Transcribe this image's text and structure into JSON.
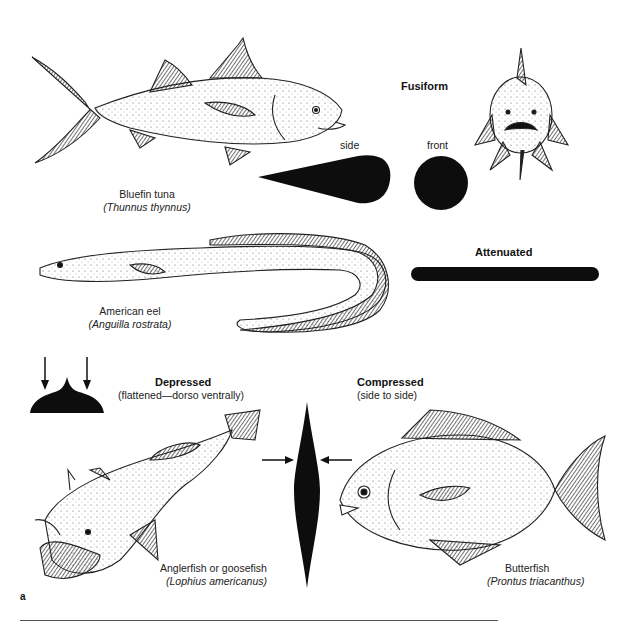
{
  "figure": {
    "panel_label": "a",
    "categories": {
      "fusiform": {
        "title": "Fusiform",
        "views": {
          "side": "side",
          "front": "front"
        }
      },
      "attenuated": {
        "title": "Attenuated"
      },
      "depressed": {
        "title": "Depressed",
        "subtitle": "(flattened—dorso ventrally)"
      },
      "compressed": {
        "title": "Compressed",
        "subtitle": "(side to side)"
      }
    },
    "specimens": {
      "tuna": {
        "common": "Bluefin tuna",
        "scientific": "(Thunnus thynnus)"
      },
      "eel": {
        "common": "American eel",
        "scientific": "(Anguilla rostrata)"
      },
      "anglerfish": {
        "common": "Anglerfish or goosefish",
        "scientific": "(Lophius americanus)"
      },
      "butterfish": {
        "common": "Butterfish",
        "scientific": "(Prontus triacanthus)"
      }
    },
    "colors": {
      "silhouette": "#0d0d0d",
      "line": "#222222",
      "rule": "#555555"
    }
  }
}
